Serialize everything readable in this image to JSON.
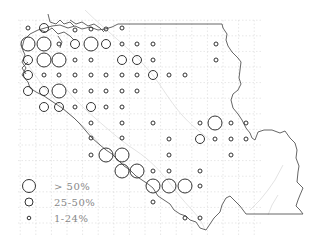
{
  "map": {
    "title": "",
    "legend": [
      {
        "label": "> 50%",
        "radius": 7,
        "class": "large"
      },
      {
        "label": "25-50%",
        "radius": 4.5,
        "class": "medium"
      },
      {
        "label": "1-24%",
        "radius": 2,
        "class": "small"
      }
    ],
    "colors": {
      "circle_stroke": "#333333",
      "boundary": "#555555",
      "grid": "#cfcfcf",
      "rivers": "#d8d8d8",
      "legend_text": "#888888"
    },
    "grid": {
      "x0": 28,
      "y0": 28,
      "step": 15.6,
      "cols": 16,
      "rows": 14
    },
    "points": [
      {
        "x": 28,
        "y": 28,
        "size": "small"
      },
      {
        "x": 44,
        "y": 28,
        "size": "medium"
      },
      {
        "x": 75,
        "y": 30,
        "size": "small"
      },
      {
        "x": 91,
        "y": 29,
        "size": "small"
      },
      {
        "x": 106,
        "y": 29,
        "size": "small"
      },
      {
        "x": 122,
        "y": 28,
        "size": "small"
      },
      {
        "x": 28,
        "y": 44,
        "size": "large"
      },
      {
        "x": 44,
        "y": 44,
        "size": "large"
      },
      {
        "x": 59,
        "y": 44,
        "size": "small"
      },
      {
        "x": 75,
        "y": 44,
        "size": "medium"
      },
      {
        "x": 91,
        "y": 44,
        "size": "large"
      },
      {
        "x": 106,
        "y": 44,
        "size": "medium"
      },
      {
        "x": 122,
        "y": 44,
        "size": "small"
      },
      {
        "x": 137,
        "y": 44,
        "size": "small"
      },
      {
        "x": 153,
        "y": 44,
        "size": "small"
      },
      {
        "x": 216,
        "y": 44,
        "size": "small"
      },
      {
        "x": 28,
        "y": 60,
        "size": "medium"
      },
      {
        "x": 44,
        "y": 60,
        "size": "large"
      },
      {
        "x": 59,
        "y": 60,
        "size": "large"
      },
      {
        "x": 75,
        "y": 60,
        "size": "small"
      },
      {
        "x": 91,
        "y": 60,
        "size": "small"
      },
      {
        "x": 122,
        "y": 60,
        "size": "medium"
      },
      {
        "x": 137,
        "y": 60,
        "size": "medium"
      },
      {
        "x": 153,
        "y": 60,
        "size": "small"
      },
      {
        "x": 216,
        "y": 60,
        "size": "small"
      },
      {
        "x": 28,
        "y": 75,
        "size": "medium"
      },
      {
        "x": 44,
        "y": 75,
        "size": "small"
      },
      {
        "x": 59,
        "y": 75,
        "size": "small"
      },
      {
        "x": 75,
        "y": 75,
        "size": "small"
      },
      {
        "x": 91,
        "y": 75,
        "size": "small"
      },
      {
        "x": 106,
        "y": 75,
        "size": "small"
      },
      {
        "x": 122,
        "y": 75,
        "size": "small"
      },
      {
        "x": 137,
        "y": 75,
        "size": "small"
      },
      {
        "x": 153,
        "y": 75,
        "size": "medium"
      },
      {
        "x": 169,
        "y": 75,
        "size": "small"
      },
      {
        "x": 185,
        "y": 75,
        "size": "small"
      },
      {
        "x": 28,
        "y": 91,
        "size": "medium"
      },
      {
        "x": 44,
        "y": 91,
        "size": "medium"
      },
      {
        "x": 59,
        "y": 91,
        "size": "large"
      },
      {
        "x": 75,
        "y": 91,
        "size": "small"
      },
      {
        "x": 91,
        "y": 91,
        "size": "small"
      },
      {
        "x": 106,
        "y": 91,
        "size": "small"
      },
      {
        "x": 122,
        "y": 91,
        "size": "small"
      },
      {
        "x": 137,
        "y": 91,
        "size": "small"
      },
      {
        "x": 44,
        "y": 107,
        "size": "medium"
      },
      {
        "x": 59,
        "y": 107,
        "size": "medium"
      },
      {
        "x": 75,
        "y": 107,
        "size": "small"
      },
      {
        "x": 91,
        "y": 107,
        "size": "medium"
      },
      {
        "x": 106,
        "y": 107,
        "size": "small"
      },
      {
        "x": 122,
        "y": 107,
        "size": "small"
      },
      {
        "x": 91,
        "y": 123,
        "size": "small"
      },
      {
        "x": 122,
        "y": 123,
        "size": "small"
      },
      {
        "x": 153,
        "y": 123,
        "size": "small"
      },
      {
        "x": 200,
        "y": 123,
        "size": "small"
      },
      {
        "x": 215,
        "y": 123,
        "size": "large"
      },
      {
        "x": 231,
        "y": 123,
        "size": "small"
      },
      {
        "x": 246,
        "y": 123,
        "size": "small"
      },
      {
        "x": 91,
        "y": 138,
        "size": "small"
      },
      {
        "x": 122,
        "y": 138,
        "size": "small"
      },
      {
        "x": 169,
        "y": 139,
        "size": "small"
      },
      {
        "x": 200,
        "y": 139,
        "size": "medium"
      },
      {
        "x": 215,
        "y": 139,
        "size": "small"
      },
      {
        "x": 231,
        "y": 139,
        "size": "small"
      },
      {
        "x": 246,
        "y": 139,
        "size": "small"
      },
      {
        "x": 91,
        "y": 155,
        "size": "small"
      },
      {
        "x": 106,
        "y": 155,
        "size": "large"
      },
      {
        "x": 122,
        "y": 155,
        "size": "large"
      },
      {
        "x": 169,
        "y": 155,
        "size": "small"
      },
      {
        "x": 231,
        "y": 155,
        "size": "small"
      },
      {
        "x": 122,
        "y": 171,
        "size": "large"
      },
      {
        "x": 137,
        "y": 171,
        "size": "large"
      },
      {
        "x": 153,
        "y": 171,
        "size": "small"
      },
      {
        "x": 169,
        "y": 171,
        "size": "small"
      },
      {
        "x": 200,
        "y": 171,
        "size": "small"
      },
      {
        "x": 153,
        "y": 186,
        "size": "large"
      },
      {
        "x": 169,
        "y": 186,
        "size": "large"
      },
      {
        "x": 185,
        "y": 186,
        "size": "large"
      },
      {
        "x": 200,
        "y": 186,
        "size": "small"
      },
      {
        "x": 153,
        "y": 202,
        "size": "small"
      },
      {
        "x": 185,
        "y": 218,
        "size": "small"
      },
      {
        "x": 200,
        "y": 218,
        "size": "small"
      }
    ]
  }
}
